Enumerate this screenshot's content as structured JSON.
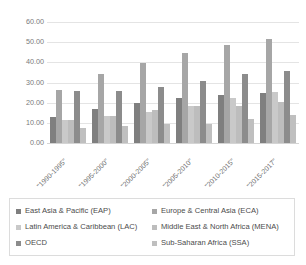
{
  "chart_data": {
    "type": "bar",
    "title": "",
    "subtitle": "",
    "xlabel": "",
    "ylabel": "",
    "grid": true,
    "legend_position": "bottom",
    "ylim": [
      0,
      60
    ],
    "yticks": [
      "0.00",
      "10.00",
      "20.00",
      "30.00",
      "40.00",
      "50.00",
      "60.00"
    ],
    "ytick_values": [
      0,
      10,
      20,
      30,
      40,
      50,
      60
    ],
    "categories": [
      "\"1990-1995\"",
      "\"1995-2000\"",
      "\"2000-2005\"",
      "\"2005-2010\"",
      "\"2010-2015\"",
      "\"2015-2017\""
    ],
    "series": [
      {
        "name": "East Asia & Pacific (EAP)",
        "color": "#7f7f7f",
        "values": [
          13.0,
          17.0,
          20.0,
          22.3,
          23.7,
          24.8
        ]
      },
      {
        "name": "Europe & Central Asia (ECA)",
        "color": "#a6a6a6",
        "values": [
          26.5,
          34.2,
          39.5,
          44.6,
          48.4,
          51.6
        ]
      },
      {
        "name": "Latin America & Caribbean (LAC)",
        "color": "#c9c9c9",
        "values": [
          11.4,
          13.6,
          15.6,
          18.2,
          22.2,
          25.1
        ]
      },
      {
        "name": "Middle East & North Africa (MENA)",
        "color": "#bdbdbd",
        "values": [
          11.3,
          13.5,
          16.6,
          18.3,
          18.5,
          20.5
        ]
      },
      {
        "name": "OECD",
        "color": "#8c8c8c",
        "values": [
          25.9,
          25.6,
          28.0,
          30.6,
          34.2,
          35.9
        ]
      },
      {
        "name": "Sub-Saharan Africa (SSA)",
        "color": "#bfbfbf",
        "values": [
          7.6,
          8.5,
          9.6,
          9.4,
          12.0,
          13.7
        ]
      }
    ]
  }
}
